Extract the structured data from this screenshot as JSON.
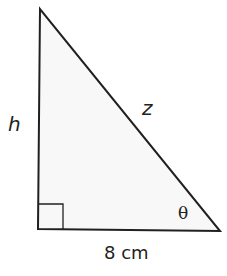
{
  "diagram": {
    "type": "right-triangle",
    "labels": {
      "height": "h",
      "hypotenuse": "z",
      "angle": "θ",
      "base": "8 cm"
    },
    "colors": {
      "stroke": "#231f20",
      "fill": "#f7f7f7"
    }
  }
}
